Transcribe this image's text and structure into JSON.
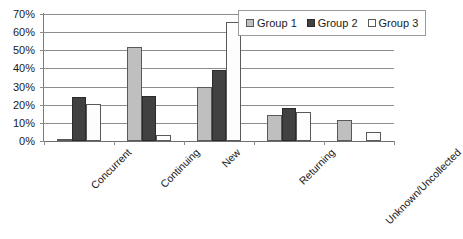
{
  "chart_data": {
    "type": "bar",
    "title": "",
    "subtitle": "",
    "xlabel": "",
    "ylabel": "",
    "ylim": [
      0,
      70
    ],
    "ytick_labels": [
      "0%",
      "10%",
      "20%",
      "30%",
      "40%",
      "50%",
      "60%",
      "70%"
    ],
    "ytick_values": [
      0,
      10,
      20,
      30,
      40,
      50,
      60,
      70
    ],
    "grid": true,
    "legend_position": "top-right",
    "categories": [
      "Concurrent",
      "Continuing",
      "New",
      "Returning",
      "Unknown/Uncollected"
    ],
    "series": [
      {
        "name": "Group 1",
        "color": "#bfbfbf",
        "values": [
          1,
          52,
          29.5,
          14.5,
          11.5
        ]
      },
      {
        "name": "Group 2",
        "color": "#414141",
        "values": [
          24,
          25,
          39,
          18,
          0
        ]
      },
      {
        "name": "Group 3",
        "color": "#ffffff",
        "values": [
          20.5,
          3.5,
          65.5,
          16,
          5
        ]
      }
    ]
  },
  "legend": {
    "entries": [
      {
        "label": "Group 1",
        "icon": "legend-swatch-icon"
      },
      {
        "label": "Group 2",
        "icon": "legend-swatch-icon"
      },
      {
        "label": "Group 3",
        "icon": "legend-swatch-icon"
      }
    ]
  }
}
